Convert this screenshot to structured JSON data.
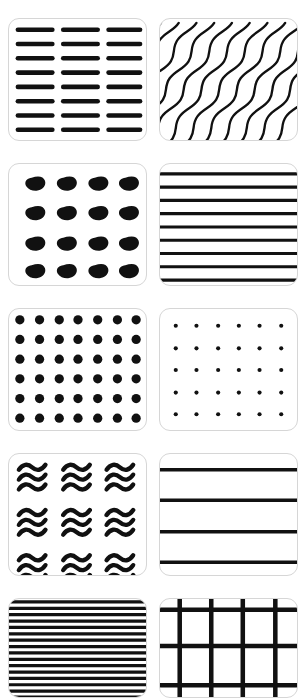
{
  "page": {
    "background_color": "#ffffff",
    "width": 307,
    "height": 689,
    "columns": 2,
    "rows": 5,
    "tile_border_color": "#d6d6d6",
    "pattern_color": "#111111",
    "tile_corner_radius": 11
  },
  "tiles": [
    {
      "index": 1,
      "position": "row-1-left",
      "name": "dashed-horizontal-bars",
      "label": "Dashed Horizontal Bars",
      "pattern_type": "dashes",
      "columns": 3,
      "rows": 8,
      "stroke_width": 4,
      "color": "#111111"
    },
    {
      "index": 2,
      "position": "row-1-right",
      "name": "diagonal-wavy-lines",
      "label": "Diagonal Wavy Lines",
      "pattern_type": "wavy-diagonal",
      "line_count": 9,
      "direction": "bottom-left-to-top-right",
      "stroke_width": 2.2,
      "color": "#111111"
    },
    {
      "index": 3,
      "position": "row-2-left",
      "name": "teardrop-comma-grid",
      "label": "Teardrop Comma Grid",
      "pattern_type": "teardrops",
      "columns": 4,
      "rows": 4,
      "color": "#111111"
    },
    {
      "index": 4,
      "position": "row-2-right",
      "name": "horizontal-stripes-medium",
      "label": "Horizontal Stripes Medium",
      "pattern_type": "stripes-horizontal",
      "line_count": 9,
      "stroke_width": 3,
      "color": "#111111"
    },
    {
      "index": 5,
      "position": "row-3-left",
      "name": "large-dot-grid",
      "label": "Large Dot Grid",
      "pattern_type": "dots",
      "columns": 7,
      "rows": 6,
      "dot_radius": 4.6,
      "color": "#111111"
    },
    {
      "index": 6,
      "position": "row-3-right",
      "name": "small-dot-grid",
      "label": "Small Dot Grid",
      "pattern_type": "dots",
      "columns": 6,
      "rows": 5,
      "dot_radius": 2.0,
      "color": "#111111"
    },
    {
      "index": 7,
      "position": "row-4-left",
      "name": "triple-wave-glyph-grid",
      "label": "Triple Wave Glyph Grid",
      "pattern_type": "wave-glyphs",
      "columns": 3,
      "rows": 3,
      "waves_per_glyph": 3,
      "stroke_width": 4,
      "color": "#111111"
    },
    {
      "index": 8,
      "position": "row-4-right",
      "name": "wide-spaced-rules",
      "label": "Wide Spaced Rules",
      "pattern_type": "stripes-horizontal",
      "line_count": 4,
      "stroke_width": 3.4,
      "color": "#111111"
    },
    {
      "index": 9,
      "position": "row-5-left",
      "name": "dense-horizontal-stripes",
      "label": "Dense Horizontal Stripes",
      "pattern_type": "stripes-horizontal",
      "line_count": 19,
      "stroke_width": 3.2,
      "clipped": true,
      "color": "#111111"
    },
    {
      "index": 10,
      "position": "row-5-right",
      "name": "lattice-grid",
      "label": "Lattice Grid",
      "pattern_type": "grid",
      "columns": 4,
      "rows": 3,
      "stroke_width": 4.5,
      "clipped": true,
      "color": "#111111"
    }
  ]
}
